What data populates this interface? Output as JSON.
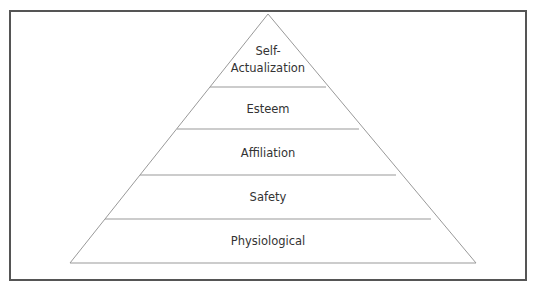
{
  "diagram": {
    "type": "pyramid",
    "levels": [
      {
        "label_lines": [
          "Self-",
          "Actualization"
        ]
      },
      {
        "label": "Esteem"
      },
      {
        "label": "Affiliation"
      },
      {
        "label": "Safety"
      },
      {
        "label": "Physiological"
      }
    ],
    "colors": {
      "border": "#555555",
      "lines": "#999999",
      "text": "#333333"
    }
  }
}
